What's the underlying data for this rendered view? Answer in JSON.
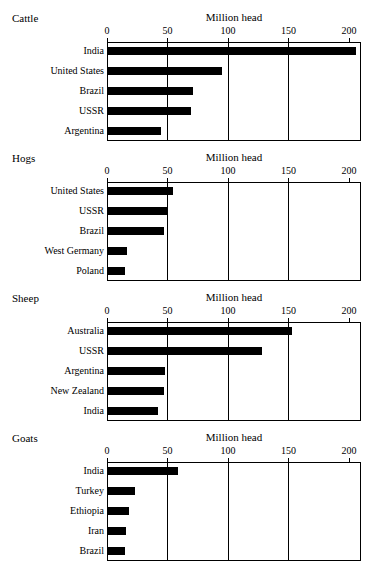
{
  "chart_data": [
    {
      "type": "bar",
      "orientation": "horizontal",
      "title": "Cattle",
      "xlabel": "Million head",
      "ylabel": "",
      "xlim": [
        0,
        210
      ],
      "xticks": [
        0,
        50,
        100,
        150,
        200
      ],
      "xticklabels": [
        "0",
        "50",
        "100",
        "150",
        "200"
      ],
      "grid": "vertical",
      "legend": "none",
      "categories": [
        "India",
        "United States",
        "Brazil",
        "USSR",
        "Argentina"
      ],
      "values": [
        205,
        94,
        70,
        69,
        44
      ]
    },
    {
      "type": "bar",
      "orientation": "horizontal",
      "title": "Hogs",
      "xlabel": "Million head",
      "ylabel": "",
      "xlim": [
        0,
        210
      ],
      "xticks": [
        0,
        50,
        100,
        150,
        200
      ],
      "xticklabels": [
        "0",
        "50",
        "100",
        "150",
        "200"
      ],
      "grid": "vertical",
      "legend": "none",
      "categories": [
        "United States",
        "USSR",
        "Brazil",
        "West Germany",
        "Poland"
      ],
      "values": [
        54,
        49,
        46,
        16,
        14
      ]
    },
    {
      "type": "bar",
      "orientation": "horizontal",
      "title": "Sheep",
      "xlabel": "Million head",
      "ylabel": "",
      "xlim": [
        0,
        210
      ],
      "xticks": [
        0,
        50,
        100,
        150,
        200
      ],
      "xticklabels": [
        "0",
        "50",
        "100",
        "150",
        "200"
      ],
      "grid": "vertical",
      "legend": "none",
      "categories": [
        "Australia",
        "USSR",
        "Argentina",
        "New Zealand",
        "India"
      ],
      "values": [
        152,
        127,
        47,
        46,
        41
      ]
    },
    {
      "type": "bar",
      "orientation": "horizontal",
      "title": "Goats",
      "xlabel": "Million head",
      "ylabel": "",
      "xlim": [
        0,
        210
      ],
      "xticks": [
        0,
        50,
        100,
        150,
        200
      ],
      "xticklabels": [
        "0",
        "50",
        "100",
        "150",
        "200"
      ],
      "grid": "vertical",
      "legend": "none",
      "categories": [
        "India",
        "Turkey",
        "Ethiopia",
        "Iran",
        "Brazil"
      ],
      "values": [
        58,
        22,
        17,
        15,
        14
      ]
    }
  ],
  "style": {
    "bar_color": "#000000",
    "axis_color": "#000000",
    "background": "#ffffff"
  }
}
